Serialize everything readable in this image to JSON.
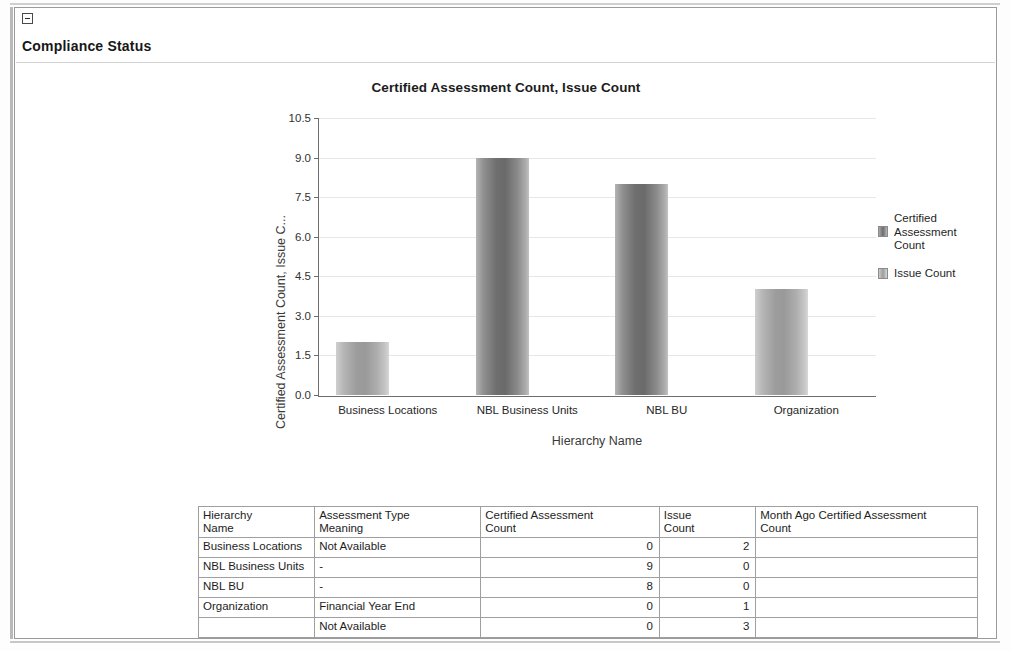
{
  "panel": {
    "collapse_icon": "collapse-minus-icon",
    "title": "Compliance Status"
  },
  "chart_data": {
    "type": "bar",
    "title": "Certified Assessment Count, Issue Count",
    "xlabel": "Hierarchy Name",
    "ylabel": "Certified Assessment Count, Issue C...",
    "ylim": [
      0,
      10.5
    ],
    "yticks": [
      "0.0",
      "1.5",
      "3.0",
      "4.5",
      "6.0",
      "7.5",
      "9.0",
      "10.5"
    ],
    "ytick_values": [
      0,
      1.5,
      3,
      4.5,
      6,
      7.5,
      9,
      10.5
    ],
    "grid": true,
    "legend_position": "right",
    "categories": [
      "Business Locations",
      "NBL  Business Units",
      "NBL BU",
      "Organization"
    ],
    "series": [
      {
        "name": "Certified Assessment Count",
        "color": "#6f6f6f",
        "values": [
          0,
          9,
          8,
          0
        ]
      },
      {
        "name": "Issue Count",
        "color": "#a0a0a0",
        "values": [
          2,
          0,
          0,
          4
        ]
      }
    ],
    "bars": [
      {
        "category": "Business Locations",
        "series": "Issue Count",
        "value": 2
      },
      {
        "category": "NBL  Business Units",
        "series": "Certified Assessment Count",
        "value": 9
      },
      {
        "category": "NBL BU",
        "series": "Certified Assessment Count",
        "value": 8
      },
      {
        "category": "Organization",
        "series": "Issue Count",
        "value": 4
      }
    ]
  },
  "legend": {
    "items": [
      {
        "label_line1": "Certified",
        "label_line2": "Assessment",
        "label_line3": "Count",
        "swatch": "swatch-cert"
      },
      {
        "label_line1": "Issue Count",
        "swatch": "swatch-issue"
      }
    ]
  },
  "table": {
    "headers": [
      "Hierarchy\nName",
      "Assessment Type\nMeaning",
      "Certified Assessment\nCount",
      "Issue\nCount",
      "Month Ago Certified Assessment\nCount"
    ],
    "header_lines": [
      [
        "Hierarchy",
        "Name"
      ],
      [
        "Assessment Type",
        "Meaning"
      ],
      [
        "Certified Assessment",
        "Count"
      ],
      [
        "Issue",
        "Count"
      ],
      [
        "Month Ago Certified Assessment",
        "Count"
      ]
    ],
    "rows": [
      {
        "hierarchy_name": "Business Locations",
        "assessment_type_meaning": "Not Available",
        "certified_assessment_count": "0",
        "issue_count": "2",
        "month_ago_certified_assessment_count": ""
      },
      {
        "hierarchy_name": "NBL Business Units",
        "assessment_type_meaning": "-",
        "certified_assessment_count": "9",
        "issue_count": "0",
        "month_ago_certified_assessment_count": ""
      },
      {
        "hierarchy_name": "NBL BU",
        "assessment_type_meaning": "-",
        "certified_assessment_count": "8",
        "issue_count": "0",
        "month_ago_certified_assessment_count": ""
      },
      {
        "hierarchy_name": "Organization",
        "assessment_type_meaning": "Financial Year End",
        "certified_assessment_count": "0",
        "issue_count": "1",
        "month_ago_certified_assessment_count": ""
      },
      {
        "hierarchy_name": "",
        "assessment_type_meaning": "Not Available",
        "certified_assessment_count": "0",
        "issue_count": "3",
        "month_ago_certified_assessment_count": ""
      }
    ]
  }
}
